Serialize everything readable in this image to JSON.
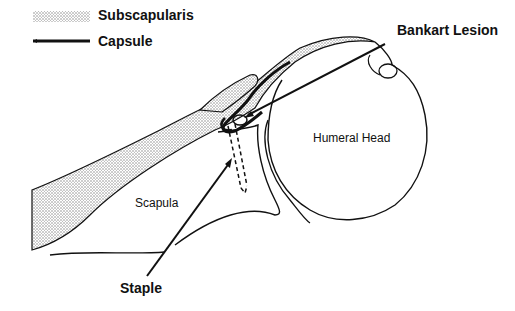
{
  "legend": {
    "items": [
      {
        "label": "Subscapularis",
        "swatch": "stippled"
      },
      {
        "label": "Capsule",
        "swatch": "thick-line"
      }
    ]
  },
  "labels": {
    "bankart": "Bankart Lesion",
    "humeral_head": "Humeral Head",
    "scapula": "Scapula",
    "staple": "Staple"
  },
  "colors": {
    "line": "#111111",
    "stipple": "#bdbdbd",
    "background": "#ffffff"
  }
}
